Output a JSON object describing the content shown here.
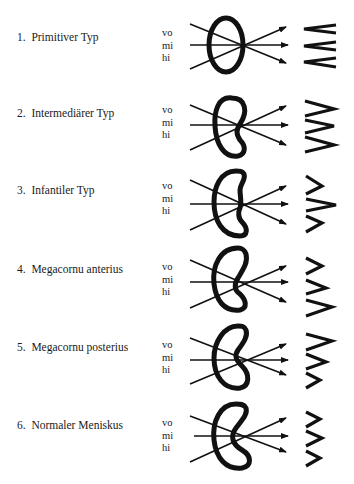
{
  "figure": {
    "direction_labels": [
      "vo",
      "mi",
      "hi"
    ],
    "rows": [
      {
        "number": "1.",
        "label": "Primitiver Typ",
        "shape": "oval",
        "zigzag": "flat"
      },
      {
        "number": "2.",
        "label": "Intermediärer Typ",
        "shape": "kidney-slight",
        "zigzag": "medium"
      },
      {
        "number": "3.",
        "label": "Infantiler Typ",
        "shape": "kidney",
        "zigzag": "middle-deep"
      },
      {
        "number": "4.",
        "label": "Megacornu anterius",
        "shape": "c-anterior",
        "zigzag": "lower-deep"
      },
      {
        "number": "5.",
        "label": "Megacornu posterius",
        "shape": "c-posterior",
        "zigzag": "upper-deep"
      },
      {
        "number": "6.",
        "label": "Normaler Meniskus",
        "shape": "c-normal",
        "zigzag": "even"
      }
    ]
  }
}
